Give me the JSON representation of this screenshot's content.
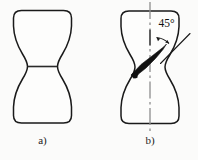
{
  "figure": {
    "background_color": "#fbfbfa",
    "ink_color": "#1a1a1a",
    "centerline_color": "#8e8e8e",
    "shear_band_color": "#111111",
    "panels": [
      {
        "id": "a",
        "caption": "a)",
        "description": "Tensile specimen with necking and marked minimum cross-section plane",
        "has_neck_line": true,
        "has_centerline": false,
        "has_shear_band": false,
        "has_angle_annotation": false
      },
      {
        "id": "b",
        "caption": "b)",
        "description": "Tensile specimen with inclined shear fracture band at 45 degrees to the axis",
        "has_neck_line": false,
        "has_centerline": true,
        "has_shear_band": true,
        "has_angle_annotation": true
      }
    ],
    "annotations": {
      "angle_label": "45°",
      "angle_value": 45,
      "angle_unit": "degrees"
    }
  }
}
